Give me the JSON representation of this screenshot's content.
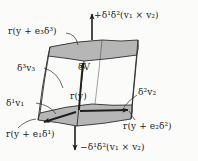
{
  "figure": {
    "kind": "math-diagram",
    "background_color": "#fbfbfa",
    "line_color": "#2b2b2b",
    "face_fill_color": "#b4b4b4",
    "labels": {
      "top_flux": "+δ¹δ²(v₁ × v₂)",
      "bottom_flux": "−δ¹δ²(v₁ × v₂)",
      "corner_e3": "r(y + e₃δ³)",
      "corner_e2": "r(y + e₂δ²)",
      "corner_e1": "r(y + e₁δ¹)",
      "origin": "r(y)",
      "edge_v1": "δ¹v₁",
      "edge_v2": "δ²v₂",
      "edge_v3": "δ³v₃",
      "volume": "δV"
    },
    "parts": {
      "top_face": "shaded-top-face",
      "bottom_face": "shaded-bottom-face",
      "vector_v1": "arrow-v1",
      "vector_v2": "arrow-v2",
      "vector_v3": "arrow-v3",
      "flux_up": "arrow-flux-up",
      "flux_down": "arrow-flux-down"
    }
  }
}
